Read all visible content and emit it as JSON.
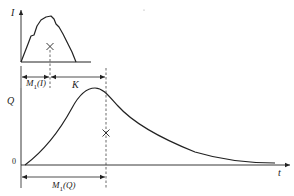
{
  "diagram": {
    "type": "hydrograph-lag-diagram",
    "top_panel": {
      "axis_label": "I",
      "centroid_marker": "×",
      "dimension_label_m1": "M",
      "dimension_label_m1_sub": "1",
      "dimension_label_m1_arg": "(I)"
    },
    "bottom_panel": {
      "axis_label": "Q",
      "origin_label": "0",
      "time_axis_label": "t",
      "centroid_marker": "×",
      "dimension_label_k": "K",
      "dimension_label_m1": "M",
      "dimension_label_m1_sub": "1",
      "dimension_label_m1_arg": "(Q)"
    },
    "colors": {
      "line": "#222222",
      "background": "#ffffff"
    }
  }
}
